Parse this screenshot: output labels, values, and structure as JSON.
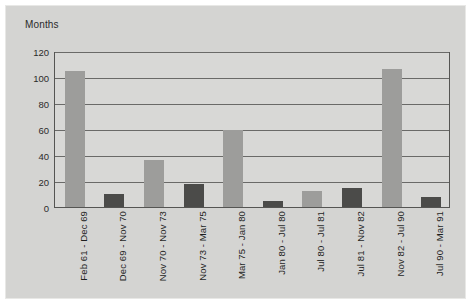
{
  "chart_data": {
    "type": "bar",
    "title": "",
    "ylabel": "Months",
    "xlabel": "",
    "ylim": [
      0,
      120
    ],
    "ytick_step": 20,
    "grid": true,
    "legend": "none",
    "categories": [
      "Feb 61 - Dec 69",
      "Dec 69 - Nov 70",
      "Nov 70 - Nov 73",
      "Nov 73 - Mar 75",
      "Mar 75 - Jan 80",
      "Jan 80 - Jul 80",
      "Jul 80 - Jul 81",
      "Jul 81 - Nov 82",
      "Nov 82 - Jul 90",
      "Jul 90 - Mar 91"
    ],
    "values": [
      105,
      10,
      36,
      18,
      59,
      5,
      12,
      15,
      106,
      8
    ],
    "bar_colors": [
      "light",
      "dark",
      "light",
      "dark",
      "light",
      "dark",
      "light",
      "dark",
      "light",
      "dark"
    ],
    "ytick_labels": [
      "120",
      "100",
      "80",
      "60",
      "40",
      "20",
      "0"
    ],
    "colors": {
      "light_bar": "#9d9d9b",
      "dark_bar": "#4b4b49",
      "plot_background": "#d8d8d6",
      "frame_background": "#d4d4d2",
      "gridline": "#6a6a68",
      "axis": "#555553",
      "text": "#1f1f1f"
    }
  }
}
